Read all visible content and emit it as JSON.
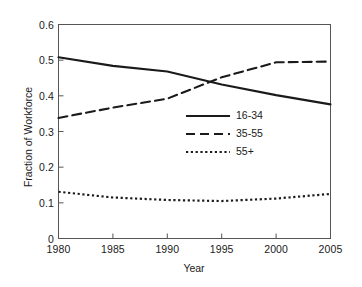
{
  "chart_data": {
    "type": "line",
    "title": "",
    "xlabel": "Year",
    "ylabel": "Fraction of Workforce",
    "xlim": [
      1980,
      2005
    ],
    "ylim": [
      0,
      0.6
    ],
    "xticks": [
      "1980",
      "1985",
      "1990",
      "1995",
      "2000",
      "2005"
    ],
    "xtick_values": [
      1980,
      1985,
      1990,
      1995,
      2000,
      2005
    ],
    "yticks": [
      "0",
      "0.1",
      "0.2",
      "0.3",
      "0.4",
      "0.5",
      "0.6"
    ],
    "ytick_values": [
      0,
      0.1,
      0.2,
      0.3,
      0.4,
      0.5,
      0.6
    ],
    "grid": false,
    "legend_position": "center-right",
    "x": [
      1980,
      1985,
      1990,
      1995,
      2000,
      2005
    ],
    "series": [
      {
        "name": "16-34",
        "style": "solid",
        "color": "#1a1a1a",
        "values": [
          0.508,
          0.484,
          0.468,
          0.432,
          0.402,
          0.376
        ]
      },
      {
        "name": "35-55",
        "style": "dashed",
        "color": "#1a1a1a",
        "values": [
          0.338,
          0.367,
          0.392,
          0.452,
          0.494,
          0.496
        ]
      },
      {
        "name": "55+",
        "style": "dotted",
        "color": "#1a1a1a",
        "values": [
          0.131,
          0.115,
          0.108,
          0.105,
          0.112,
          0.125
        ]
      }
    ],
    "annotations": {
      "crossover_year": 1993,
      "crossover_value": 0.455
    }
  },
  "legend": {
    "entries": [
      {
        "label": "16-34"
      },
      {
        "label": "35-55"
      },
      {
        "label": "55+"
      }
    ]
  }
}
